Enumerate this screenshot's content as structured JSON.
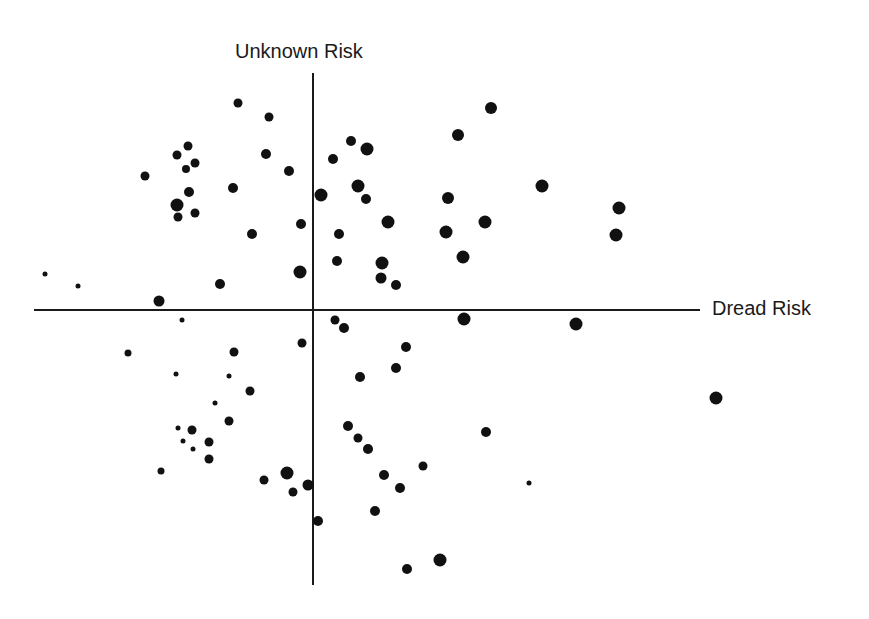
{
  "chart_data": {
    "type": "scatter",
    "title": "",
    "xlabel": "Dread Risk",
    "ylabel": "Unknown Risk",
    "grid": false,
    "legend": null,
    "axes_style": "cross-hair axes through origin, no ticks",
    "pixel_origin": [
      313,
      310
    ],
    "axis_extent_px": {
      "x_left": 34,
      "x_right": 700,
      "y_top": 73,
      "y_bottom": 585
    },
    "point_color": "#111111",
    "points": [
      {
        "x": 238,
        "y": 103,
        "r": 4.5
      },
      {
        "x": 269,
        "y": 117,
        "r": 4.5
      },
      {
        "x": 188,
        "y": 146,
        "r": 4.5
      },
      {
        "x": 177,
        "y": 155,
        "r": 4.5
      },
      {
        "x": 195,
        "y": 163,
        "r": 4.5
      },
      {
        "x": 186,
        "y": 169,
        "r": 4
      },
      {
        "x": 145,
        "y": 176,
        "r": 4.5
      },
      {
        "x": 266,
        "y": 154,
        "r": 5
      },
      {
        "x": 289,
        "y": 171,
        "r": 5
      },
      {
        "x": 189,
        "y": 192,
        "r": 5
      },
      {
        "x": 233,
        "y": 188,
        "r": 5
      },
      {
        "x": 177,
        "y": 205,
        "r": 6.5
      },
      {
        "x": 178,
        "y": 217,
        "r": 4.5
      },
      {
        "x": 195,
        "y": 213,
        "r": 4.5
      },
      {
        "x": 301,
        "y": 224,
        "r": 5
      },
      {
        "x": 252,
        "y": 234,
        "r": 5
      },
      {
        "x": 45,
        "y": 274,
        "r": 2.5
      },
      {
        "x": 78,
        "y": 286,
        "r": 2.5
      },
      {
        "x": 220,
        "y": 284,
        "r": 5
      },
      {
        "x": 300,
        "y": 272,
        "r": 6.5
      },
      {
        "x": 159,
        "y": 301,
        "r": 5.5
      },
      {
        "x": 491,
        "y": 108,
        "r": 6
      },
      {
        "x": 458,
        "y": 135,
        "r": 6
      },
      {
        "x": 351,
        "y": 141,
        "r": 5
      },
      {
        "x": 367,
        "y": 149,
        "r": 6.5
      },
      {
        "x": 333,
        "y": 159,
        "r": 5
      },
      {
        "x": 358,
        "y": 186,
        "r": 6.5
      },
      {
        "x": 366,
        "y": 199,
        "r": 5
      },
      {
        "x": 321,
        "y": 195,
        "r": 6.5
      },
      {
        "x": 448,
        "y": 198,
        "r": 6
      },
      {
        "x": 542,
        "y": 186,
        "r": 6.5
      },
      {
        "x": 619,
        "y": 208,
        "r": 6.5
      },
      {
        "x": 388,
        "y": 222,
        "r": 6.5
      },
      {
        "x": 485,
        "y": 222,
        "r": 6.5
      },
      {
        "x": 339,
        "y": 234,
        "r": 5
      },
      {
        "x": 446,
        "y": 232,
        "r": 6.5
      },
      {
        "x": 616,
        "y": 235,
        "r": 6.5
      },
      {
        "x": 337,
        "y": 261,
        "r": 5
      },
      {
        "x": 463,
        "y": 257,
        "r": 6.5
      },
      {
        "x": 382,
        "y": 263,
        "r": 6.5
      },
      {
        "x": 381,
        "y": 278,
        "r": 5.5
      },
      {
        "x": 396,
        "y": 285,
        "r": 5
      },
      {
        "x": 182,
        "y": 320,
        "r": 2.5
      },
      {
        "x": 128,
        "y": 353,
        "r": 3.5
      },
      {
        "x": 234,
        "y": 352,
        "r": 4.5
      },
      {
        "x": 302,
        "y": 343,
        "r": 4.5
      },
      {
        "x": 176,
        "y": 374,
        "r": 2.5
      },
      {
        "x": 229,
        "y": 376,
        "r": 2.5
      },
      {
        "x": 250,
        "y": 391,
        "r": 4.5
      },
      {
        "x": 215,
        "y": 403,
        "r": 2.5
      },
      {
        "x": 229,
        "y": 421,
        "r": 4.5
      },
      {
        "x": 178,
        "y": 428,
        "r": 2.5
      },
      {
        "x": 192,
        "y": 430,
        "r": 4.5
      },
      {
        "x": 183,
        "y": 441,
        "r": 2.5
      },
      {
        "x": 209,
        "y": 442,
        "r": 4.5
      },
      {
        "x": 193,
        "y": 449,
        "r": 2.5
      },
      {
        "x": 209,
        "y": 459,
        "r": 4.5
      },
      {
        "x": 161,
        "y": 471,
        "r": 3.5
      },
      {
        "x": 287,
        "y": 473,
        "r": 6.5
      },
      {
        "x": 264,
        "y": 480,
        "r": 4.5
      },
      {
        "x": 308,
        "y": 485,
        "r": 5.5
      },
      {
        "x": 293,
        "y": 492,
        "r": 4.5
      },
      {
        "x": 335,
        "y": 320,
        "r": 4.5
      },
      {
        "x": 344,
        "y": 328,
        "r": 5
      },
      {
        "x": 464,
        "y": 319,
        "r": 6.5
      },
      {
        "x": 576,
        "y": 324,
        "r": 6.5
      },
      {
        "x": 406,
        "y": 347,
        "r": 5
      },
      {
        "x": 396,
        "y": 368,
        "r": 5
      },
      {
        "x": 360,
        "y": 377,
        "r": 5
      },
      {
        "x": 348,
        "y": 426,
        "r": 5
      },
      {
        "x": 358,
        "y": 438,
        "r": 4.5
      },
      {
        "x": 368,
        "y": 449,
        "r": 5
      },
      {
        "x": 486,
        "y": 432,
        "r": 5
      },
      {
        "x": 423,
        "y": 466,
        "r": 4.5
      },
      {
        "x": 384,
        "y": 475,
        "r": 5
      },
      {
        "x": 400,
        "y": 488,
        "r": 5
      },
      {
        "x": 529,
        "y": 483,
        "r": 2.5
      },
      {
        "x": 375,
        "y": 511,
        "r": 5
      },
      {
        "x": 318,
        "y": 521,
        "r": 5
      },
      {
        "x": 407,
        "y": 569,
        "r": 5
      },
      {
        "x": 440,
        "y": 560,
        "r": 6.5
      },
      {
        "x": 716,
        "y": 398,
        "r": 6.5
      }
    ],
    "note": "Point coordinates are pixel positions in the 869x619 image; x grows rightward (more dread), y grows downward (less unknown)."
  },
  "labels": {
    "y_axis": "Unknown Risk",
    "x_axis": "Dread Risk"
  }
}
